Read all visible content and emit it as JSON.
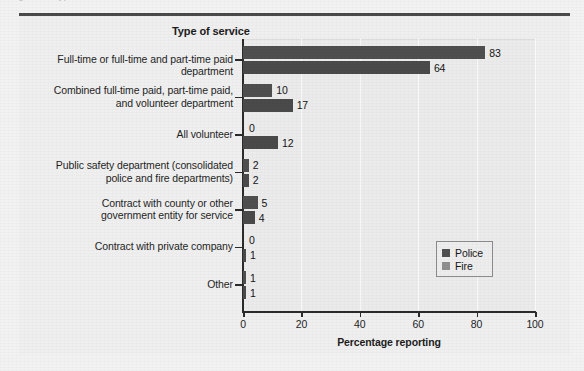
{
  "figure": {
    "cutoff_text": "Figure ...    Type ...",
    "panel_title": "Type of service"
  },
  "legend": {
    "position": "inside-right",
    "entries": [
      {
        "label": "Police",
        "color": "#4f4f4f"
      },
      {
        "label": "Fire",
        "color": "#8f8f8f"
      }
    ]
  },
  "axis": {
    "x_title": "Percentage reporting",
    "x_ticks": [
      "0",
      "20",
      "40",
      "60",
      "80",
      "100"
    ]
  },
  "chart_data": {
    "type": "bar",
    "orientation": "horizontal",
    "title": "Type of service",
    "xlabel": "Percentage reporting",
    "ylabel": "",
    "xlim": [
      0,
      100
    ],
    "grid": "vertical-gridlines-at-ticks",
    "legend_position": "inside-right",
    "categories": [
      "Full-time or full-time and part-time paid department",
      "Combined full-time paid, part-time paid,\nand volunteer department",
      "All volunteer",
      "Public safety department (consolidated\npolice and fire departments)",
      "Contract with county or other\ngovernment entity for service",
      "Contract with private company",
      "Other"
    ],
    "series": [
      {
        "name": "Police",
        "color": "#4f4f4f",
        "values": [
          83,
          10,
          0,
          2,
          5,
          0,
          1
        ]
      },
      {
        "name": "Fire",
        "color": "#8f8f8f",
        "values": [
          64,
          17,
          12,
          2,
          4,
          1,
          1
        ]
      }
    ],
    "value_labels": {
      "Police": [
        "83",
        "10",
        "0",
        "2",
        "5",
        "0",
        "1"
      ],
      "Fire": [
        "64",
        "17",
        "12",
        "2",
        "4",
        "1",
        "1"
      ]
    }
  }
}
